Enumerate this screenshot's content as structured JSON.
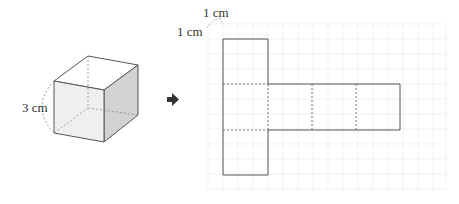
{
  "cube": {
    "edge_label": "3 cm",
    "colors": {
      "front": "#eeeeee",
      "side": "#cfcfcf",
      "top": "#ffffff",
      "edge": "#555555",
      "hidden": "#888888"
    }
  },
  "arrow": {
    "icon": "right-arrow-icon",
    "color": "#333333"
  },
  "grid": {
    "unit_label_x": "1 cm",
    "unit_label_y": "1 cm",
    "cell_px": 15,
    "color": "#ececec"
  },
  "net": {
    "description": "T-shaped net of a cube: vertical column of 3 squares with a horizontal strip of 3 squares to the right of the middle square",
    "edge_color": "#555555"
  }
}
